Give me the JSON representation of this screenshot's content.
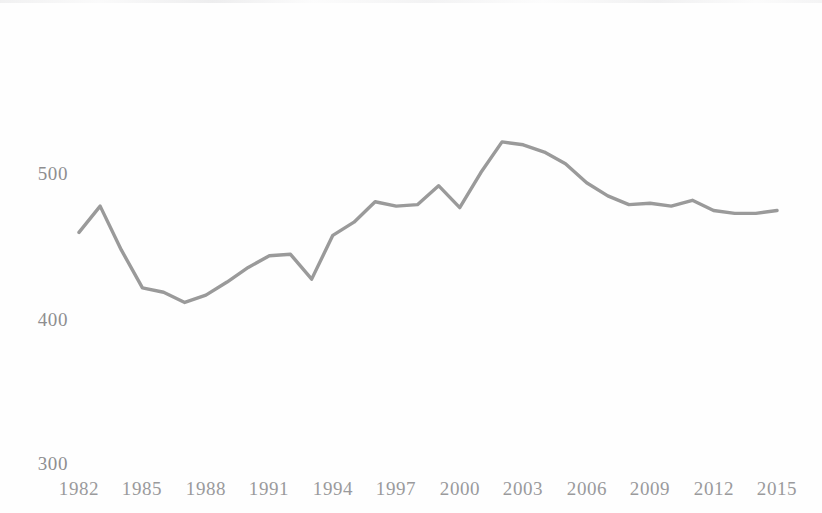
{
  "chart_data": {
    "type": "line",
    "title": "",
    "subtitle": "",
    "xlabel": "",
    "ylabel": "",
    "x": [
      1982,
      1983,
      1984,
      1985,
      1986,
      1987,
      1988,
      1989,
      1990,
      1991,
      1992,
      1993,
      1994,
      1995,
      1996,
      1997,
      1998,
      1999,
      2000,
      2001,
      2002,
      2003,
      2004,
      2005,
      2006,
      2007,
      2008,
      2009,
      2010,
      2011,
      2012,
      2013,
      2014,
      2015
    ],
    "values": [
      460,
      478,
      448,
      422,
      419,
      412,
      417,
      426,
      436,
      444,
      445,
      428,
      458,
      467,
      481,
      478,
      479,
      492,
      477,
      501,
      522,
      520,
      515,
      507,
      494,
      485,
      479,
      480,
      478,
      482,
      475,
      473,
      473,
      475
    ],
    "series": [
      {
        "name": "",
        "values": [
          460,
          478,
          448,
          422,
          419,
          412,
          417,
          426,
          436,
          444,
          445,
          428,
          458,
          467,
          481,
          478,
          479,
          492,
          477,
          501,
          522,
          520,
          515,
          507,
          494,
          485,
          479,
          480,
          478,
          482,
          475,
          473,
          473,
          475
        ],
        "color": "#9a9a9a"
      }
    ],
    "xlim": [
      1982,
      2015
    ],
    "ylim": [
      300,
      540
    ],
    "x_tick_labels": [
      "1982",
      "1985",
      "1988",
      "1991",
      "1994",
      "1997",
      "2000",
      "2003",
      "2006",
      "2009",
      "2012",
      "2015"
    ],
    "x_tick_values": [
      1982,
      1985,
      1988,
      1991,
      1994,
      1997,
      2000,
      2003,
      2006,
      2009,
      2012,
      2015
    ],
    "y_tick_labels": [
      "500",
      "400",
      "300"
    ],
    "y_tick_values": [
      500,
      400,
      300
    ],
    "grid": false,
    "legend": "none",
    "line_color": "#9a9a9a",
    "axis_text_color": "#949496",
    "background_color": "#fefefe",
    "annotations": []
  }
}
